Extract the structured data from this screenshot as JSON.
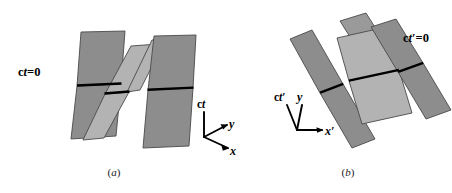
{
  "figure": {
    "width": 452,
    "height": 193,
    "background": "#ffffff",
    "colors": {
      "slab_dark": "#8d8d8d",
      "slab_light": "#b3b3b3",
      "slab_mid": "#9a9a9a",
      "outline": "#4a4a4a",
      "simultaneity_line": "#000000",
      "axis": "#000000",
      "text": "#000000"
    }
  },
  "panel_a": {
    "caption": "(a)",
    "simultaneity_label": "ct=0",
    "axes": {
      "vertical_label": "ct",
      "depth_label": "y",
      "horizontal_label": "x"
    }
  },
  "panel_b": {
    "caption": "(b)",
    "simultaneity_label": "ct'=0",
    "axes": {
      "vertical_label": "ct'",
      "depth_label": "y",
      "horizontal_label": "x'"
    }
  },
  "chart_data": {
    "type": "diagram",
    "title": "",
    "panels": [
      {
        "id": "a",
        "caption": "(a)",
        "annotations": [
          "ct=0"
        ],
        "axis_triad": [
          "ct",
          "y",
          "x"
        ],
        "slab_count": 4,
        "slab_shades": [
          "dark",
          "light",
          "light",
          "dark"
        ]
      },
      {
        "id": "b",
        "caption": "(b)",
        "annotations": [
          "ct'=0"
        ],
        "axis_triad": [
          "ct'",
          "y",
          "x'"
        ],
        "slab_count": 4,
        "slab_shades": [
          "dark",
          "light",
          "light",
          "dark"
        ]
      }
    ]
  }
}
